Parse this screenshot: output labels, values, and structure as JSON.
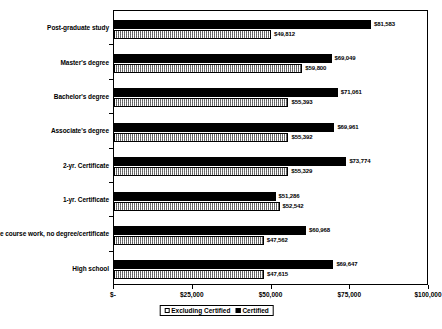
{
  "chart_data": {
    "type": "bar",
    "orientation": "horizontal",
    "title": "",
    "subtitle": "",
    "xlabel": "",
    "ylabel": "",
    "xlim": [
      0,
      100000
    ],
    "grid": false,
    "legend_position": "bottom",
    "categories": [
      "Post-graduate study",
      "Master's degree",
      "Bachelor's degree",
      "Associate's degree",
      "2-yr. Certificate",
      "1-yr. Certificate",
      "Some college course work, no degree/certificate",
      "High school"
    ],
    "xticks": [
      {
        "value": 0,
        "label": "$-"
      },
      {
        "value": 25000,
        "label": "$25,000"
      },
      {
        "value": 50000,
        "label": "$50,000"
      },
      {
        "value": 75000,
        "label": "$75,000"
      },
      {
        "value": 100000,
        "label": "$100,000"
      }
    ],
    "series": [
      {
        "name": "Certified",
        "fill": "solid-black",
        "color": "#000000",
        "values": [
          81583,
          69049,
          71061,
          69961,
          73774,
          51286,
          60968,
          69647
        ],
        "labels": [
          "$81,583",
          "$69,049",
          "$71,061",
          "$69,961",
          "$73,774",
          "$51,286",
          "$60,968",
          "$69,647"
        ]
      },
      {
        "name": "Excluding Certified",
        "fill": "hatched-gray",
        "color": "#c9c9c9",
        "values": [
          49812,
          59800,
          55393,
          55392,
          55329,
          52542,
          47562,
          47615
        ],
        "labels": [
          "$49,812",
          "$59,800",
          "$55,393",
          "$55,392",
          "$55,329",
          "$52,542",
          "$47,562",
          "$47,615"
        ]
      }
    ]
  },
  "legend": {
    "entries": [
      {
        "label": "Excluding Certified"
      },
      {
        "label": "Certified"
      }
    ]
  }
}
